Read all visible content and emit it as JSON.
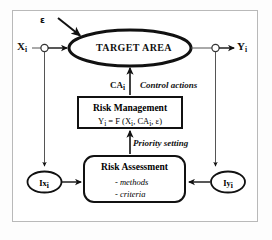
{
  "diagram": {
    "frame": {
      "border_color": "#b9b9b9",
      "background": "#ffffff"
    },
    "nodes": {
      "target_area": {
        "label": "TARGET AREA",
        "shape": "ellipse"
      },
      "risk_management": {
        "title": "Risk Management",
        "formula_prefix": "Y",
        "formula_sub": "i",
        "formula_mid": " = F (X",
        "formula_sub2": "i",
        "formula_mid2": ", CA",
        "formula_sub3": "i",
        "formula_tail": ", ε)",
        "formula_full": "Yᵢ = F (Xᵢ, CAᵢ, ε)",
        "shape": "rectangle"
      },
      "risk_assessment": {
        "title": "Risk Assessment",
        "items": [
          "- methods",
          "- criteria"
        ],
        "shape": "rounded-rectangle"
      },
      "input_indicator": {
        "label_main": "Ix",
        "label_sub": "i",
        "shape": "ellipse"
      },
      "output_indicator": {
        "label_main": "Iy",
        "label_sub": "i",
        "shape": "ellipse"
      }
    },
    "labels": {
      "epsilon": "ε",
      "input_main": "X",
      "input_sub": "i",
      "output_main": "Y",
      "output_sub": "i",
      "control_actions_symbol": "CA",
      "control_actions_symbol_sub": "i",
      "control_actions_text": "Control actions",
      "priority_setting_text": "Priority setting"
    },
    "colors": {
      "stroke": "#111111",
      "thin_stroke": "#555555",
      "frame": "#b9b9b9",
      "background": "#ffffff"
    }
  }
}
